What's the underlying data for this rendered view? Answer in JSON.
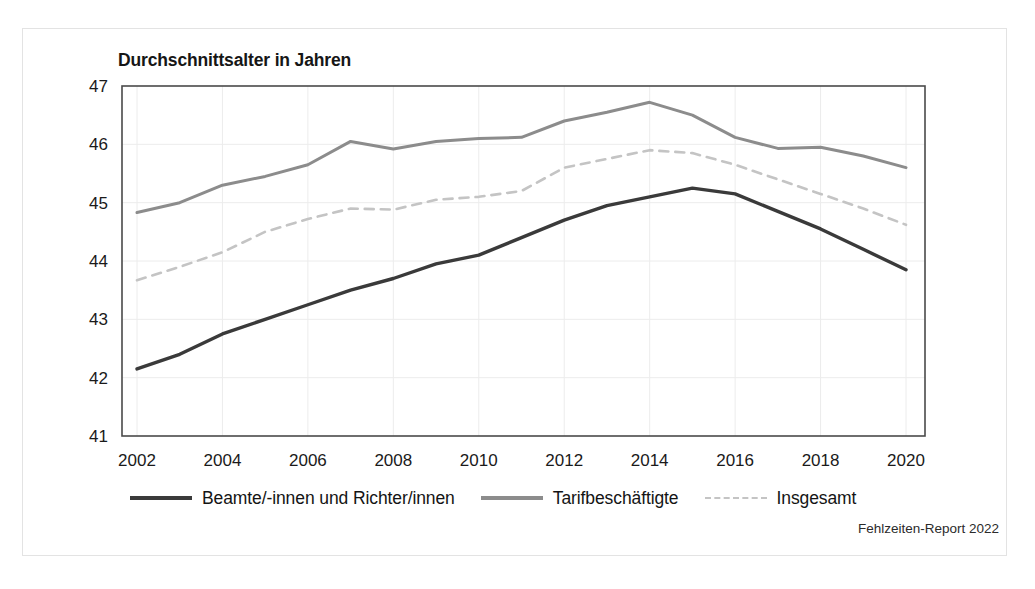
{
  "figure": {
    "title": "Durchschnittsalter in Jahren",
    "source_note": "Fehlzeiten-Report 2022"
  },
  "legend": {
    "items": [
      {
        "label": "Beamte/-innen und Richter/innen",
        "style": "solid",
        "color": "#3a3a3a"
      },
      {
        "label": "Tarifbeschäftigte",
        "style": "solid",
        "color": "#8c8c8c"
      },
      {
        "label": "Insgesamt",
        "style": "dashed",
        "color": "#c4c4c4"
      }
    ]
  },
  "chart_data": {
    "type": "line",
    "title": "Durchschnittsalter in Jahren",
    "xlabel": "",
    "ylabel": "Durchschnittsalter in Jahren",
    "xlim": [
      2002,
      2020
    ],
    "ylim": [
      41,
      47
    ],
    "yticks": [
      41,
      42,
      43,
      44,
      45,
      46,
      47
    ],
    "xticks": [
      2002,
      2004,
      2006,
      2008,
      2010,
      2012,
      2014,
      2016,
      2018,
      2020
    ],
    "grid": true,
    "legend_position": "bottom",
    "x": [
      2002,
      2003,
      2004,
      2005,
      2006,
      2007,
      2008,
      2009,
      2010,
      2011,
      2012,
      2013,
      2014,
      2015,
      2016,
      2017,
      2018,
      2019,
      2020
    ],
    "series": [
      {
        "name": "Beamte/-innen und Richter/innen",
        "style": "solid",
        "color": "#3a3a3a",
        "values": [
          42.15,
          42.4,
          42.75,
          43.0,
          43.25,
          43.5,
          43.7,
          43.95,
          44.1,
          44.4,
          44.7,
          44.95,
          45.1,
          45.25,
          45.15,
          44.85,
          44.55,
          44.2,
          43.85
        ]
      },
      {
        "name": "Tarifbeschäftigte",
        "style": "solid",
        "color": "#8c8c8c",
        "values": [
          44.83,
          45.0,
          45.3,
          45.45,
          45.65,
          46.05,
          45.92,
          46.05,
          46.1,
          46.12,
          46.4,
          46.55,
          46.72,
          46.5,
          46.12,
          45.93,
          45.95,
          45.8,
          45.6
        ]
      },
      {
        "name": "Insgesamt",
        "style": "dashed",
        "color": "#c4c4c4",
        "values": [
          43.67,
          43.9,
          44.15,
          44.5,
          44.72,
          44.9,
          44.88,
          45.05,
          45.1,
          45.2,
          45.6,
          45.75,
          45.9,
          45.85,
          45.65,
          45.4,
          45.15,
          44.9,
          44.62
        ]
      }
    ]
  }
}
